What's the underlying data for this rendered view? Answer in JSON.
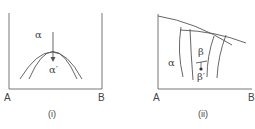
{
  "diagram_i": {
    "axis_left": "A",
    "axis_right": "B",
    "caption": "(i)",
    "phase_top": "α",
    "phase_bottom": "α′"
  },
  "diagram_ii": {
    "axis_left": "A",
    "axis_right": "B",
    "caption": "(ii)",
    "phase_left": "α",
    "phase_upper": "β",
    "phase_lower": "β′"
  },
  "colors": {
    "line": "#555555",
    "text": "#444444"
  }
}
